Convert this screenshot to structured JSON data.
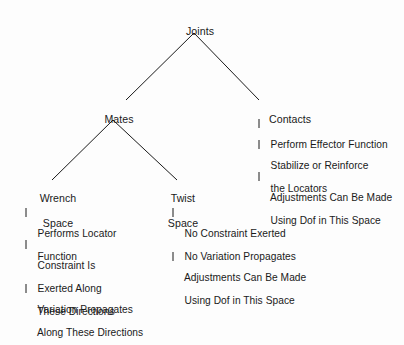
{
  "diagram": {
    "type": "tree",
    "background_color": "#fdfdfd",
    "line_color": "#1a1a1a",
    "text_color": "#1a1a1a",
    "root": {
      "label": "Joints"
    },
    "level2": {
      "mates": "Mates",
      "contacts": "Contacts"
    },
    "level3": {
      "wrench_space_line1": "Wrench",
      "wrench_space_line2": "Space",
      "twist_space_line1": "Twist",
      "twist_space_line2": "Space"
    },
    "contacts_details": {
      "item1": "Perform Effector Function",
      "item2_line1": "Stabilize or Reinforce",
      "item2_line2": "the Locators",
      "item3_line1": "Adjustments Can Be Made",
      "item3_line2": "Using Dof in This Space"
    },
    "wrench_details": {
      "item1_line1": "Performs Locator",
      "item1_line2": "Function",
      "item2_line1": "Constraint Is",
      "item2_line2": "Exerted Along",
      "item2_line3": "These Directions",
      "item3_line1": "Variation Propagates",
      "item3_line2": "Along These Directions"
    },
    "twist_details": {
      "item1_line1": "No Constraint Exerted",
      "item1_line2": "No Variation Propagates",
      "item2_line1": "Adjustments Can Be Made",
      "item2_line2": "Using Dof in This Space"
    }
  }
}
